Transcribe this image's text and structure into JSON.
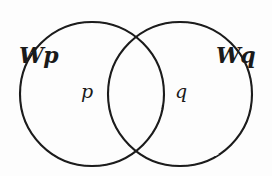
{
  "figure": {
    "type": "venn-diagram",
    "background_color": "#fdfdfd",
    "stroke_color": "#1a1a1a",
    "labels": {
      "left_set": "Wp",
      "right_set": "Wq",
      "left_region": "p",
      "right_region": "q"
    },
    "geometry": {
      "left_circle": {
        "cx": 92,
        "cy": 94,
        "r": 72
      },
      "right_circle": {
        "cx": 180,
        "cy": 94,
        "r": 72
      },
      "stroke_width": 2.1
    }
  }
}
